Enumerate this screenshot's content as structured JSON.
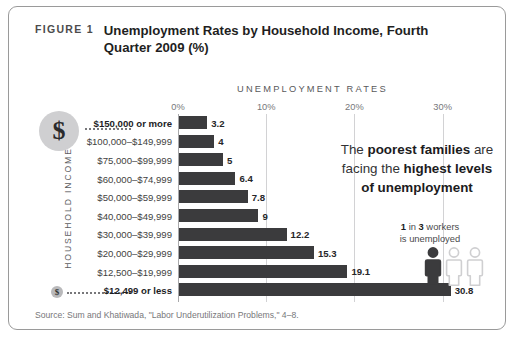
{
  "figure": {
    "label": "FIGURE 1",
    "title": "Unemployment Rates by Household Income, Fourth Quarter 2009 (%)"
  },
  "axis_header": "UNEMPLOYMENT RATES",
  "y_axis_title": "HOUSEHOLD INCOME",
  "callout": {
    "line1_a": "The ",
    "line1_b": "poorest families",
    "line1_c": " are",
    "line2_a": "facing the ",
    "line2_b": "highest levels",
    "line3": "of unemployment"
  },
  "pictogram": {
    "count_highlight": "1",
    "text_mid": " in ",
    "total_highlight": "3",
    "text_end": " workers",
    "line2": "is unemployed",
    "filled": 1,
    "total": 3,
    "filled_color": "#3b3b3d",
    "empty_color": "#cfcfd1"
  },
  "badges": {
    "big_symbol": "$",
    "small_symbol": "$"
  },
  "source": "Source: Sum and Khatiwada, \"Labor Underutilization Problems,\" 4–8.",
  "colors": {
    "bar": "#3b3b3d",
    "grid": "#d2d2d4",
    "border": "#9a9a9a"
  },
  "chart_data": {
    "type": "bar",
    "orientation": "horizontal",
    "title": "Unemployment Rates by Household Income, Fourth Quarter 2009 (%)",
    "xlabel": "UNEMPLOYMENT RATES",
    "ylabel": "HOUSEHOLD INCOME",
    "xlim": [
      0,
      33
    ],
    "xticks": [
      0,
      10,
      20,
      30
    ],
    "xtick_labels": [
      "0%",
      "10%",
      "20%",
      "30%"
    ],
    "grid": true,
    "legend": false,
    "categories": [
      "$150,000 or more",
      "$100,000–$149,999",
      "$75,000–$99,999",
      "$60,000–$74,999",
      "$50,000–$59,999",
      "$40,000–$49,999",
      "$30,000–$39,999",
      "$20,000–$29,999",
      "$12,500–$19,999",
      "$12,499 or less"
    ],
    "values": [
      3.2,
      4,
      5,
      6.4,
      7.8,
      9,
      12.2,
      15.3,
      19.1,
      30.8
    ],
    "value_labels": [
      "3.2",
      "4",
      "5",
      "6.4",
      "7.8",
      "9",
      "12.2",
      "15.3",
      "19.1",
      "30.8"
    ],
    "emphasized_categories": [
      "$150,000 or more",
      "$12,499 or less"
    ],
    "annotations": [
      "The poorest families are facing the highest levels of unemployment",
      "1 in 3 workers is unemployed"
    ]
  }
}
